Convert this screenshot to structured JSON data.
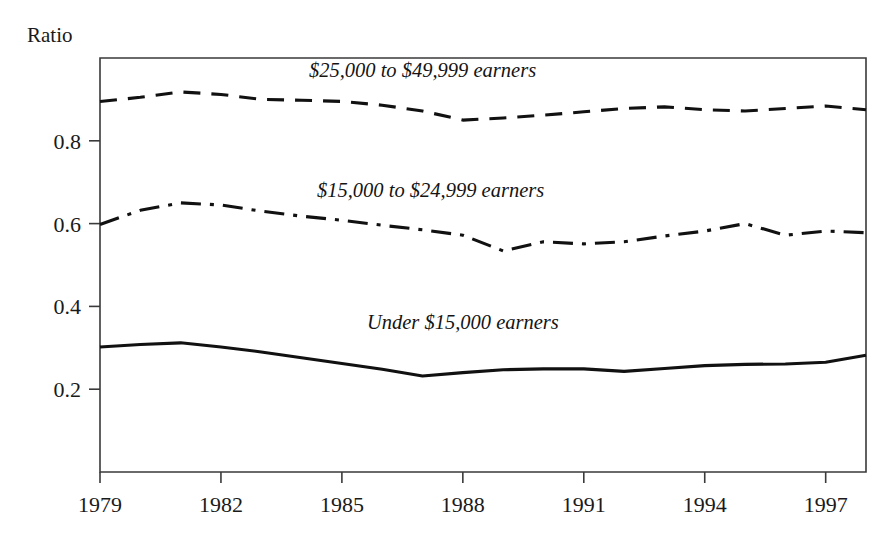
{
  "figure": {
    "y_axis_title": "Ratio",
    "background_color": "#ffffff",
    "ink_color": "#111111",
    "frame_color": "#3a3a3a"
  },
  "chart_data": {
    "type": "line",
    "title": "",
    "xlabel": "",
    "ylabel": "Ratio",
    "xlim": [
      1979,
      1998
    ],
    "ylim": [
      0,
      1.0
    ],
    "grid": false,
    "legend_position": "inline-annotations",
    "x_ticks": [
      1979,
      1982,
      1985,
      1988,
      1991,
      1994,
      1997
    ],
    "x_tick_labels": [
      "1979",
      "1982",
      "1985",
      "1988",
      "1991",
      "1994",
      "1997"
    ],
    "y_ticks": [
      0.2,
      0.4,
      0.6,
      0.8
    ],
    "y_tick_labels": [
      "0.2",
      "0.4",
      "0.6",
      "0.8"
    ],
    "x": [
      1979,
      1980,
      1981,
      1982,
      1983,
      1984,
      1985,
      1986,
      1987,
      1988,
      1989,
      1990,
      1991,
      1992,
      1993,
      1994,
      1995,
      1996,
      1997,
      1998
    ],
    "series": [
      {
        "name": "$25,000 to $49,999 earners",
        "dash_style": "dashed",
        "label_x": 1987.0,
        "label_y": 0.955,
        "values": [
          0.895,
          0.905,
          0.918,
          0.912,
          0.9,
          0.898,
          0.895,
          0.886,
          0.872,
          0.85,
          0.855,
          0.862,
          0.87,
          0.878,
          0.882,
          0.875,
          0.872,
          0.878,
          0.884,
          0.875
        ]
      },
      {
        "name": "$15,000 to $24,999 earners",
        "dash_style": "dashdot",
        "label_x": 1987.2,
        "label_y": 0.665,
        "values": [
          0.598,
          0.632,
          0.65,
          0.645,
          0.63,
          0.618,
          0.608,
          0.596,
          0.585,
          0.572,
          0.534,
          0.556,
          0.551,
          0.556,
          0.57,
          0.582,
          0.6,
          0.572,
          0.582,
          0.578
        ]
      },
      {
        "name": "Under $15,000 earners",
        "dash_style": "solid",
        "label_x": 1988.0,
        "label_y": 0.345,
        "values": [
          0.302,
          0.308,
          0.312,
          0.302,
          0.29,
          0.276,
          0.262,
          0.248,
          0.232,
          0.24,
          0.247,
          0.249,
          0.249,
          0.243,
          0.25,
          0.257,
          0.26,
          0.261,
          0.265,
          0.282
        ]
      }
    ]
  }
}
